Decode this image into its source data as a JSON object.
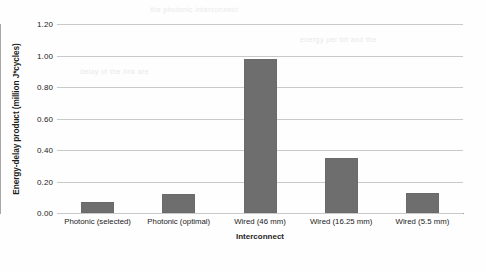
{
  "chart_data": {
    "type": "bar",
    "title": "",
    "xlabel": "Interconnect",
    "ylabel": "Energy-delay product (million J*cycles)",
    "categories": [
      "Photonic (selected)",
      "Photonic (optimal)",
      "Wired (46 mm)",
      "Wired (16.25 mm)",
      "Wired (5.5 mm)"
    ],
    "values": [
      0.07,
      0.12,
      0.98,
      0.35,
      0.13
    ],
    "ylim": [
      0.0,
      1.2
    ],
    "yticks": [
      "0.00",
      "0.20",
      "0.40",
      "0.60",
      "0.80",
      "1.00",
      "1.20"
    ],
    "ytick_values": [
      0.0,
      0.2,
      0.4,
      0.6,
      0.8,
      1.0,
      1.2
    ],
    "grid": true,
    "legend": false,
    "legend_position": "none",
    "bar_color": "#6e6e6e",
    "gridline_color": "#c9c9c9",
    "axis_color": "#9a9a9a",
    "background_color": "#fefefe"
  },
  "bleed_text": {
    "line1": "the photonic interconnect",
    "line2": "energy per bit and the",
    "line3": "delay of the link are",
    "line4": "compared for several",
    "line5": "wire lengths in the chip"
  }
}
